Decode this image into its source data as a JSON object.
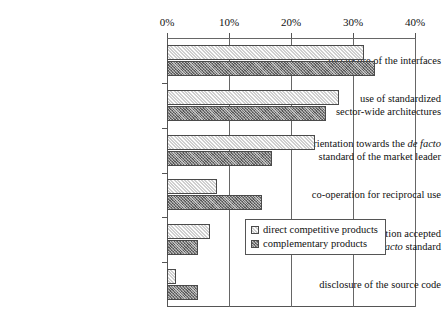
{
  "chart_data": {
    "type": "bar",
    "orientation": "horizontal",
    "title": "",
    "xlabel": "",
    "ylabel": "",
    "xlim": [
      0,
      40
    ],
    "xtick_labels": [
      "0%",
      "10%",
      "20%",
      "30%",
      "40%"
    ],
    "xticks": [
      0,
      10,
      20,
      30,
      40
    ],
    "grid": true,
    "grid_axis": "x",
    "legend_position": "center-right",
    "categories": [
      "disclosure of the interfaces",
      "use of standardized sector-wide architectures",
      "orientation towards the de facto standard of the market leader",
      "co-operation for reciprocal use",
      "get own solution accepted as de facto standard",
      "disclosure of the source code"
    ],
    "category_lines": [
      [
        "disclosure of the interfaces"
      ],
      [
        "use of standardized",
        "sector-wide architectures"
      ],
      [
        "orientation towards the |de facto|",
        "standard of the market leader"
      ],
      [
        "co-operation for reciprocal use"
      ],
      [
        "get own solution accepted",
        "as |de facto| standard"
      ],
      [
        "disclosure of the source code"
      ]
    ],
    "series": [
      {
        "name": "direct competitive products",
        "fill": "light-hatch",
        "color": "#cfcfcf",
        "values": [
          31.8,
          27.8,
          23.9,
          8.1,
          7.0,
          1.5
        ]
      },
      {
        "name": "complementary products",
        "fill": "dark-crosshatch",
        "color": "#7e7e7e",
        "values": [
          33.5,
          25.6,
          16.9,
          15.4,
          5.0,
          5.0
        ]
      }
    ]
  },
  "legend": {
    "items": [
      {
        "label": "direct competitive products",
        "swatch": "light-hatch"
      },
      {
        "label": "complementary products",
        "swatch": "dark-crosshatch"
      }
    ]
  },
  "axis": {
    "ticks": [
      {
        "label": "0%"
      },
      {
        "label": "10%"
      },
      {
        "label": "20%"
      },
      {
        "label": "30%"
      },
      {
        "label": "40%"
      }
    ]
  }
}
